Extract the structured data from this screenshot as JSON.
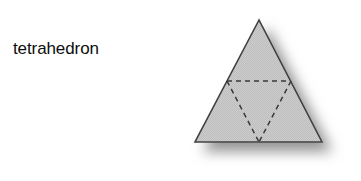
{
  "page": {
    "background_color": "#ffffff",
    "width": 361,
    "height": 181
  },
  "label": {
    "text": "tetrahedron",
    "color": "#0d0d0d",
    "font_size_px": 17
  },
  "figure": {
    "name": "tetrahedron",
    "fill_color": "#c9c9c9",
    "stroke_color": "#3f3f3f",
    "stroke_width_px": 1.6,
    "hidden_edge_color": "#3a3a3a",
    "hidden_edge_width_px": 1.5,
    "hidden_edge_dash": "5,4",
    "shadow_color": "#9a9a9a",
    "shadow_offset_x_px": 9,
    "shadow_offset_y_px": 9,
    "shadow_blur_px": 7,
    "outline_points": "81,14 17,136 144,136",
    "hidden_edge_horizontal": "49,75 113,75",
    "hidden_edge_left": "49,75 81,136",
    "hidden_edge_right": "113,75 81,136",
    "vertices": {
      "apex": "259,20",
      "bottom_left": "195,142",
      "bottom_right": "322,142",
      "base_midpoint": "259,142",
      "left_side_midpoint": "228,81",
      "right_side_midpoint": "290,81"
    }
  }
}
